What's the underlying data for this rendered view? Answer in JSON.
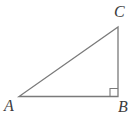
{
  "figure": {
    "type": "right-triangle-diagram",
    "background_color": "#ffffff",
    "stroke_color": "#7a7a7a",
    "label_color": "#3c3c3c",
    "stroke_width": 1.3,
    "canvas": {
      "width": 138,
      "height": 118
    },
    "vertices": [
      {
        "name": "A",
        "label": "A",
        "x": 19,
        "y": 96.5,
        "label_x": 4,
        "label_y": 98
      },
      {
        "name": "B",
        "label": "B",
        "x": 118,
        "y": 96.5,
        "label_x": 118,
        "label_y": 99
      },
      {
        "name": "C",
        "label": "C",
        "x": 118,
        "y": 27,
        "label_x": 114,
        "label_y": 4
      }
    ],
    "edges": [
      {
        "name": "AB",
        "from": "A",
        "to": "B",
        "orientation": "horizontal"
      },
      {
        "name": "BC",
        "from": "B",
        "to": "C",
        "orientation": "vertical"
      },
      {
        "name": "CA",
        "from": "C",
        "to": "A",
        "orientation": "hypotenuse"
      }
    ],
    "right_angle": {
      "at_vertex": "B",
      "marker": "square",
      "size": 8,
      "corner_x": 110,
      "corner_y": 88.5
    },
    "path_outline": "M 19 96.5 L 118 96.5 L 118 27 Z",
    "path_right_angle": "M 110 96.5 L 110 88.5 L 118 88.5"
  }
}
